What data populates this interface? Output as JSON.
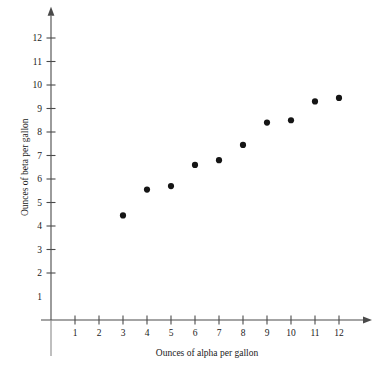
{
  "chart_data": {
    "type": "scatter",
    "title": "",
    "xlabel": "Ounces of alpha per gallon",
    "ylabel": "Ounces of beta per gallon",
    "xlim": [
      0,
      13
    ],
    "ylim": [
      0,
      12.8
    ],
    "grid": false,
    "legend": null,
    "xticks": [
      1,
      2,
      3,
      4,
      5,
      6,
      7,
      8,
      9,
      10,
      11,
      12
    ],
    "xtick_labels": [
      "1",
      "2",
      "3",
      "4",
      "5",
      "6",
      "7",
      "8",
      "9",
      "10",
      "11",
      "12"
    ],
    "yticks": [
      1,
      2,
      3,
      4,
      5,
      6,
      7,
      8,
      9,
      10,
      11,
      12
    ],
    "ytick_labels": [
      "1",
      "2",
      "3",
      "4",
      "5",
      "6",
      "7",
      "8",
      "9",
      "10",
      "11",
      "12"
    ],
    "x": [
      3,
      4,
      5,
      6,
      7,
      8,
      9,
      10,
      11,
      12
    ],
    "y": [
      4.45,
      5.55,
      5.7,
      6.6,
      6.8,
      7.45,
      8.4,
      8.5,
      9.3,
      9.45
    ],
    "points": [
      {
        "x": 3,
        "y": 4.45
      },
      {
        "x": 4,
        "y": 5.55
      },
      {
        "x": 5,
        "y": 5.7
      },
      {
        "x": 6,
        "y": 6.6
      },
      {
        "x": 7,
        "y": 6.8
      },
      {
        "x": 8,
        "y": 7.45
      },
      {
        "x": 9,
        "y": 8.4
      },
      {
        "x": 10,
        "y": 8.5
      },
      {
        "x": 11,
        "y": 9.3
      },
      {
        "x": 12,
        "y": 9.45
      }
    ],
    "marker": "filled-circle",
    "marker_color": "#151515",
    "marker_size": 3.1,
    "axis_color": "#4a4a4a",
    "background_color": "#ffffff"
  }
}
